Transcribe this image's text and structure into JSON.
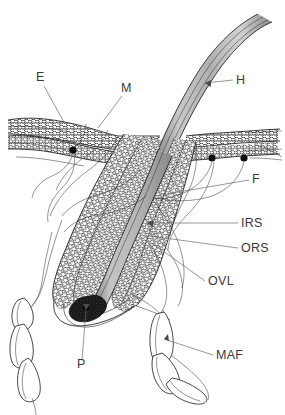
{
  "figure": {
    "background_color": "#ffffff",
    "width": 285,
    "height": 415
  },
  "palette": {
    "ink": "#1c1c1c",
    "leader": "#6b6b6b",
    "label_text": "#3a3a3a",
    "shaft_light": "#d6d6d6",
    "shaft_mid": "#b3b3b3",
    "shaft_dark": "#8a8a8a",
    "papilla": "#141414",
    "paper": "#ffffff"
  },
  "labels": [
    {
      "id": "E",
      "text": "E",
      "x": 36,
      "y": 81,
      "anchor": "start",
      "name": "label-epidermis"
    },
    {
      "id": "M",
      "text": "M",
      "x": 121,
      "y": 92,
      "anchor": "start",
      "name": "label-melanocyte"
    },
    {
      "id": "H",
      "text": "H",
      "x": 236,
      "y": 84,
      "anchor": "start",
      "name": "label-hair-shaft"
    },
    {
      "id": "F",
      "text": "F",
      "x": 252,
      "y": 183,
      "anchor": "start",
      "name": "label-free-nerve-endings"
    },
    {
      "id": "IRS",
      "text": "IRS",
      "x": 241,
      "y": 227,
      "anchor": "start",
      "name": "label-inner-root-sheath"
    },
    {
      "id": "ORS",
      "text": "ORS",
      "x": 241,
      "y": 252,
      "anchor": "start",
      "name": "label-outer-root-sheath"
    },
    {
      "id": "OVL",
      "text": "OVL",
      "x": 208,
      "y": 285,
      "anchor": "start",
      "name": "label-outer-vitreous-layer"
    },
    {
      "id": "P",
      "text": "P",
      "x": 77,
      "y": 368,
      "anchor": "start",
      "name": "label-papilla"
    },
    {
      "id": "MAF",
      "text": "MAF",
      "x": 216,
      "y": 359,
      "anchor": "start",
      "name": "label-muscle-arrector-fibers"
    }
  ],
  "leaders": [
    {
      "id": "E",
      "d": "M 44 86 L 65 124",
      "name": "leader-epidermis"
    },
    {
      "id": "M",
      "d": "M 122 96 L 98 128",
      "name": "leader-melanocyte"
    },
    {
      "id": "H",
      "d": "M 233 80 L 205 83",
      "name": "leader-hair-shaft"
    },
    {
      "id": "F",
      "d": "M 249 180 L 155 196",
      "name": "leader-free-nerve-endings"
    },
    {
      "id": "IRS",
      "d": "M 238 223 L 147 223",
      "name": "leader-inner-root-sheath"
    },
    {
      "id": "ORS",
      "d": "M 238 248 L 150 236",
      "name": "leader-outer-root-sheath"
    },
    {
      "id": "OVL",
      "d": "M 205 281 L 152 243",
      "name": "leader-outer-vitreous-layer"
    },
    {
      "id": "P",
      "d": "M 82 360 L 86 310",
      "name": "leader-papilla"
    },
    {
      "id": "MAF",
      "d": "M 213 355 L 164 339",
      "name": "leader-muscle-arrector-fibers"
    }
  ],
  "structures": {
    "hair_shaft": "curved gray band emerging from follicle to upper right",
    "epidermis_left": "stratified cellular band, upper left",
    "epidermis_right": "stratified cellular band, upper right",
    "follicle_sheaths": "concentric braided layers descending to bulb",
    "papilla": "dark stippled dermal papilla at follicle base",
    "maf_left": "chain of elongated muscle fiber segments, lower left",
    "maf_right": "chain of elongated muscle fiber segments, lower right",
    "nerve_endings": "three dark terminal dots with trailing fibers"
  }
}
